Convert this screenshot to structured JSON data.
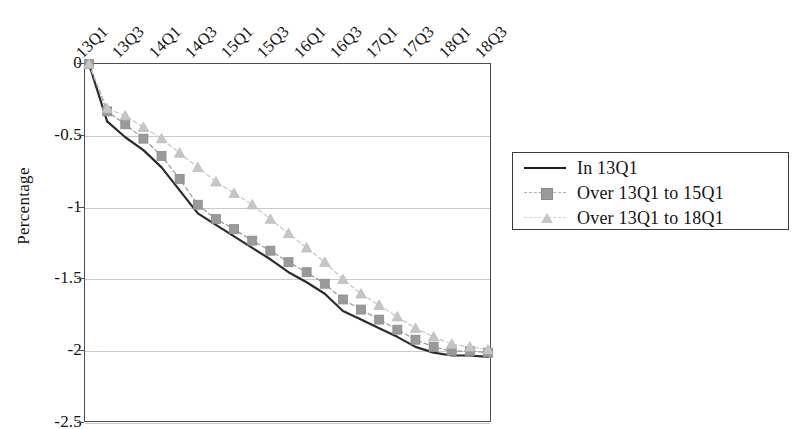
{
  "chart_data": {
    "type": "line",
    "title": "",
    "xlabel": "",
    "ylabel": "Percentage",
    "ylim": [
      -2.5,
      0
    ],
    "yticks": [
      "0",
      "-0.5",
      "-1",
      "-1.5",
      "-2",
      "-2.5"
    ],
    "ytick_values": [
      0,
      -0.5,
      -1,
      -1.5,
      -2,
      -2.5
    ],
    "grid": true,
    "legend_position": "right",
    "x": [
      "13Q1",
      "13Q2",
      "13Q3",
      "13Q4",
      "14Q1",
      "14Q2",
      "14Q3",
      "14Q4",
      "15Q1",
      "15Q2",
      "15Q3",
      "15Q4",
      "16Q1",
      "16Q2",
      "16Q3",
      "16Q4",
      "17Q1",
      "17Q2",
      "17Q3",
      "17Q4",
      "18Q1",
      "18Q2",
      "18Q3"
    ],
    "xtick_labels": [
      "13Q1",
      "13Q3",
      "14Q1",
      "14Q3",
      "15Q1",
      "15Q3",
      "16Q1",
      "16Q3",
      "17Q1",
      "17Q3",
      "18Q1",
      "18Q3"
    ],
    "xtick_indices": [
      0,
      2,
      4,
      6,
      8,
      10,
      12,
      14,
      16,
      18,
      20,
      22
    ],
    "series": [
      {
        "name": "In 13Q1",
        "style": "solid",
        "marker": "none",
        "color": "#2b2b2b",
        "values": [
          0,
          -0.4,
          -0.51,
          -0.6,
          -0.72,
          -0.88,
          -1.04,
          -1.12,
          -1.2,
          -1.28,
          -1.36,
          -1.45,
          -1.52,
          -1.6,
          -1.72,
          -1.78,
          -1.84,
          -1.9,
          -1.97,
          -2.01,
          -2.03,
          -2.03,
          -2.04
        ]
      },
      {
        "name": "Over 13Q1 to 15Q1",
        "style": "dashed",
        "marker": "square",
        "color": "#9a9a9a",
        "values": [
          0,
          -0.33,
          -0.42,
          -0.52,
          -0.64,
          -0.8,
          -0.98,
          -1.08,
          -1.15,
          -1.23,
          -1.3,
          -1.38,
          -1.45,
          -1.53,
          -1.64,
          -1.71,
          -1.78,
          -1.85,
          -1.92,
          -1.97,
          -2.0,
          -2.0,
          -2.01
        ]
      },
      {
        "name": "Over 13Q1 to 18Q1",
        "style": "dashed",
        "marker": "triangle",
        "color": "#c6c6c6",
        "values": [
          0,
          -0.31,
          -0.36,
          -0.44,
          -0.52,
          -0.62,
          -0.72,
          -0.82,
          -0.9,
          -0.98,
          -1.08,
          -1.18,
          -1.28,
          -1.38,
          -1.5,
          -1.6,
          -1.68,
          -1.76,
          -1.84,
          -1.9,
          -1.95,
          -1.97,
          -1.99
        ]
      }
    ]
  },
  "legend": {
    "items": [
      {
        "label": "In 13Q1"
      },
      {
        "label": "Over 13Q1 to 15Q1"
      },
      {
        "label": "Over 13Q1 to 18Q1"
      }
    ]
  },
  "axis": {
    "y_title": "Percentage"
  }
}
